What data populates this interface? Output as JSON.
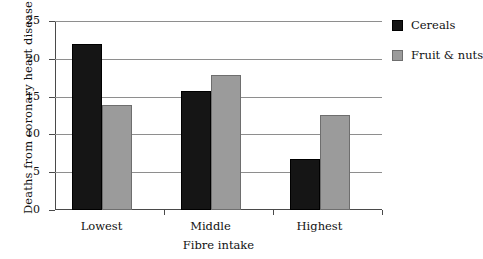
{
  "chart_data": {
    "type": "bar",
    "title": "",
    "subtitle": "",
    "xlabel": "Fibre intake",
    "ylabel": "Deaths from coronary heart disease",
    "categories": [
      "Lowest",
      "Middle",
      "Highest"
    ],
    "series": [
      {
        "name": "Cereals",
        "color": "#151515",
        "values": [
          22.0,
          15.8,
          6.7
        ]
      },
      {
        "name": "Fruit & nuts",
        "color": "#9b9b9b",
        "values": [
          13.9,
          17.8,
          12.6
        ]
      }
    ],
    "ylim": [
      0,
      25
    ],
    "ytick_labels": [
      "0",
      "5",
      "10",
      "15",
      "20",
      "25"
    ],
    "ytick_values": [
      0,
      5,
      10,
      15,
      20,
      25
    ],
    "grid": true,
    "grid_axis": "y",
    "legend_position": "right-top",
    "annotations": []
  }
}
